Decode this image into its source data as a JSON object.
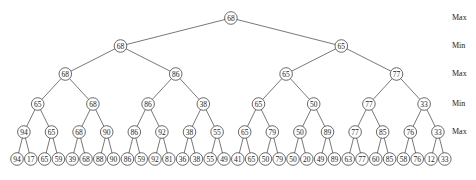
{
  "diagram": {
    "type": "minimax game tree",
    "level_labels": [
      "Max",
      "Min",
      "Max",
      "Min",
      "Max"
    ],
    "levels": [
      [
        68
      ],
      [
        68,
        65
      ],
      [
        68,
        86,
        65,
        77
      ],
      [
        65,
        68,
        86,
        38,
        65,
        50,
        77,
        33
      ],
      [
        94,
        65,
        68,
        90,
        86,
        92,
        38,
        55,
        65,
        79,
        50,
        89,
        77,
        85,
        76,
        33
      ],
      [
        94,
        17,
        65,
        59,
        39,
        68,
        88,
        90,
        86,
        59,
        92,
        81,
        36,
        38,
        55,
        49,
        41,
        65,
        50,
        79,
        50,
        20,
        49,
        89,
        63,
        77,
        60,
        85,
        58,
        76,
        12,
        33
      ]
    ]
  }
}
